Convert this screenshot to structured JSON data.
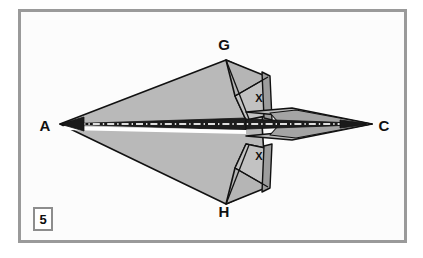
{
  "figure": {
    "domain_note": "origami paper-airplane folding diagram",
    "step_number": "5",
    "frame_color": "#9a9a9a",
    "paper_fill": "#b9b9b9",
    "paper_fill_dark": "#a3a3a3",
    "paper_fill_light": "#c9c9c9",
    "outline_color": "#111111",
    "background": "#fcfcfc",
    "center_line_style": "dash-dot white on dark band"
  },
  "labels": [
    {
      "id": "label-a",
      "text": "A",
      "x": 45,
      "y": 131,
      "role": "vertex-left-nose"
    },
    {
      "id": "label-c",
      "text": "C",
      "x": 384,
      "y": 131,
      "role": "vertex-right-tail"
    },
    {
      "id": "label-g",
      "text": "G",
      "x": 224,
      "y": 50,
      "role": "vertex-top"
    },
    {
      "id": "label-h",
      "text": "H",
      "x": 224,
      "y": 217,
      "role": "vertex-bottom"
    },
    {
      "id": "label-x-top",
      "text": "X",
      "x": 259,
      "y": 102,
      "role": "fold-marker-top"
    },
    {
      "id": "label-x-bottom",
      "text": "X",
      "x": 259,
      "y": 160,
      "role": "fold-marker-bottom"
    }
  ],
  "geometry": {
    "nose_point": [
      60,
      124
    ],
    "tail_point": [
      372,
      124
    ],
    "top_vertex": [
      226,
      60
    ],
    "bottom_vertex": [
      226,
      204
    ],
    "spine_y": 124
  }
}
